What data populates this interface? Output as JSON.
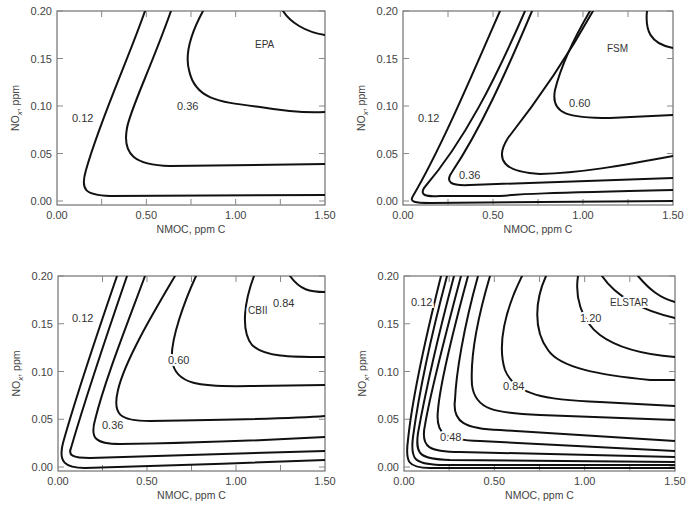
{
  "chart_data": [
    {
      "type": "contour",
      "title": "EPA",
      "xlabel": "NMOC, ppm C",
      "ylabel": "NOx, ppm",
      "xlim": [
        0.0,
        1.5
      ],
      "ylim": [
        0.0,
        0.2
      ],
      "xticks": [
        "0.00",
        "0.50",
        "1.00",
        "1.50"
      ],
      "yticks": [
        "0.00",
        "0.05",
        "0.10",
        "0.15",
        "0.20"
      ],
      "grid": false,
      "contour_labels": [
        "0.12",
        "0.36"
      ],
      "num_contours": 4,
      "frame": {
        "x": 57,
        "y": 11,
        "w": 268,
        "h": 194
      },
      "paths": [
        "M 145 11 C 128 60, 100 120, 86 170 C 80 190, 85 195, 110 196 L 325 195",
        "M 171 11 C 150 70, 130 110, 127 128 C 122 155, 135 165, 170 166 L 325 164",
        "M 203 11 C 190 35, 185 55, 189 70 C 195 100, 220 102, 260 107 C 290 112, 310 113, 325 112",
        "M 283 11 C 290 22, 305 32, 325 35"
      ],
      "label_positions": [
        {
          "text": "0.12",
          "x": 72,
          "y": 122
        },
        {
          "text": "0.36",
          "x": 177,
          "y": 110
        }
      ],
      "model_label": {
        "text": "EPA",
        "x": 255,
        "y": 48
      }
    },
    {
      "type": "contour",
      "title": "FSM",
      "xlabel": "NMOC, ppm C",
      "ylabel": "NOx, ppm",
      "xlim": [
        0.0,
        1.5
      ],
      "ylim": [
        0.0,
        0.2
      ],
      "xticks": [
        "0.00",
        "0.50",
        "1.00",
        "1.50"
      ],
      "yticks": [
        "0.00",
        "0.05",
        "0.10",
        "0.15",
        "0.20"
      ],
      "grid": false,
      "contour_labels": [
        "0.12",
        "0.36",
        "0.60"
      ],
      "num_contours": 7,
      "frame": {
        "x": 403,
        "y": 11,
        "w": 270,
        "h": 194
      },
      "paths": [
        "M 500 11 C 470 80, 440 150, 413 196 C 409 202, 415 203, 430 203 L 673 201",
        "M 525 11 C 495 80, 465 140, 424 188 C 420 195, 425 197, 440 196 L 500 196 C 520 194, 540 193, 673 190",
        "M 532 11 C 505 75, 480 130, 452 172 C 445 182, 450 186, 470 185 L 673 178",
        "M 593 11 C 560 70, 530 110, 508 138 C 494 160, 504 172, 540 174 C 580 173, 620 166, 673 156",
        "M 590 11 C 570 45, 560 70, 555 90 C 550 115, 570 118, 610 118 L 673 115",
        "M 647 11 C 645 30, 650 44, 673 48"
      ],
      "label_positions": [
        {
          "text": "0.12",
          "x": 418,
          "y": 122
        },
        {
          "text": "0.36",
          "x": 459,
          "y": 179
        },
        {
          "text": "0.60",
          "x": 569,
          "y": 107
        }
      ],
      "model_label": {
        "text": "FSM",
        "x": 607,
        "y": 52
      }
    },
    {
      "type": "contour",
      "title": "CBII",
      "xlabel": "NMOC, ppm C",
      "ylabel": "NOx, ppm",
      "xlim": [
        0.0,
        1.5
      ],
      "ylim": [
        0.0,
        0.2
      ],
      "xticks": [
        "0.00",
        "0.50",
        "1.00",
        "1.50"
      ],
      "yticks": [
        "0.00",
        "0.05",
        "0.10",
        "0.15",
        "0.20"
      ],
      "grid": false,
      "contour_labels": [
        "0.12",
        "0.36",
        "0.60",
        "0.84"
      ],
      "num_contours": 8,
      "frame": {
        "x": 58,
        "y": 276,
        "w": 267,
        "h": 195
      },
      "paths": [
        "M 117 276 C 95 340, 75 400, 63 443 C 58 462, 65 468, 85 468 C 150 466, 250 463, 325 460",
        "M 127 276 C 105 340, 85 400, 71 448 C 68 455, 72 458, 90 458 L 325 451",
        "M 145 276 C 125 330, 105 380, 95 420 C 90 438, 95 444, 120 444 C 200 443, 270 440, 325 437",
        "M 175 276 C 155 310, 125 360, 118 390 C 112 415, 120 421, 150 421 C 220 420, 290 419, 325 416",
        "M 196 276 C 185 300, 170 340, 172 360 C 175 385, 200 387, 250 386 L 325 385",
        "M 254 276 C 245 300, 240 330, 252 345 C 265 357, 290 357, 325 357",
        "M 290 276 C 300 290, 310 292, 325 292"
      ],
      "label_positions": [
        {
          "text": "0.12",
          "x": 72,
          "y": 322
        },
        {
          "text": "0.36",
          "x": 102,
          "y": 429
        },
        {
          "text": "0.60",
          "x": 168,
          "y": 364
        },
        {
          "text": "0.84",
          "x": 273,
          "y": 307
        }
      ],
      "model_label": {
        "text": "CBII",
        "x": 248,
        "y": 314
      }
    },
    {
      "type": "contour",
      "title": "ELSTAR",
      "xlabel": "NMOC, ppm C",
      "ylabel": "NOx, ppm",
      "xlim": [
        0.0,
        1.5
      ],
      "ylim": [
        0.0,
        0.2
      ],
      "xticks": [
        "0.00",
        "0.50",
        "1.00",
        "1.50"
      ],
      "yticks": [
        "0.00",
        "0.05",
        "0.10",
        "0.15",
        "0.20"
      ],
      "grid": false,
      "contour_labels": [
        "0.12",
        "0.48",
        "0.84",
        "1.20"
      ],
      "num_contours": 14,
      "frame": {
        "x": 404,
        "y": 276,
        "w": 271,
        "h": 195
      },
      "paths": [
        "M 441 276 C 425 340, 412 400, 408 440 C 405 462, 408 468, 430 468 L 675 468",
        "M 447 276 C 430 340, 418 400, 413 437 C 410 460, 415 464, 440 465 L 675 465",
        "M 454 276 C 437 340, 424 400, 418 433 C 415 455, 420 459, 450 460 L 675 462",
        "M 461 276 C 444 340, 430 395, 425 425 C 420 448, 430 452, 460 452 L 675 457",
        "M 468 276 C 452 335, 440 385, 438 410 C 435 435, 445 440, 480 441 L 675 451",
        "M 478 276 C 463 330, 456 375, 455 400 C 452 422, 465 429, 500 430 L 675 441",
        "M 490 276 C 477 320, 470 355, 472 385 C 475 410, 495 413, 540 415 L 675 420",
        "M 522 276 C 505 310, 497 345, 505 370 C 515 395, 545 400, 600 402 L 675 406",
        "M 546 276 C 535 300, 533 330, 548 350 C 560 368, 600 375, 650 380 L 675 380",
        "M 578 276 C 575 295, 580 320, 600 335 C 620 350, 650 355, 675 357",
        "M 602 276 C 615 295, 640 310, 675 318",
        "M 638 276 C 650 290, 660 298, 675 302"
      ],
      "label_positions": [
        {
          "text": "0.12",
          "x": 411,
          "y": 306
        },
        {
          "text": "0.48",
          "x": 440,
          "y": 441
        },
        {
          "text": "0.84",
          "x": 503,
          "y": 390
        },
        {
          "text": "1.20",
          "x": 580,
          "y": 322
        }
      ],
      "model_label": {
        "text": "ELSTAR",
        "x": 610,
        "y": 306
      }
    }
  ],
  "axes": {
    "xlabel": "NMOC, ppm C",
    "ylabel_main": "NO",
    "ylabel_sub": "x",
    "ylabel_rest": ", ppm",
    "xticks": [
      "0.00",
      "0.50",
      "1.00",
      "1.50"
    ],
    "yticks": [
      "0.20",
      "0.15",
      "0.10",
      "0.05",
      "0.00"
    ]
  }
}
